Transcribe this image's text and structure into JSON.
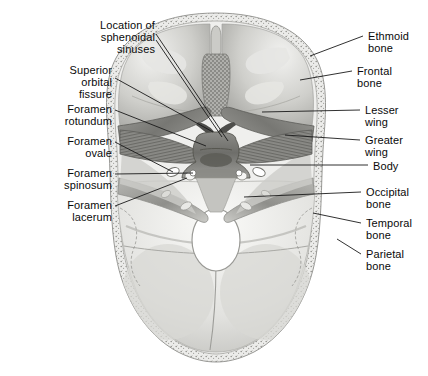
{
  "figure": {
    "type": "anatomical-illustration",
    "background_color": "#ffffff",
    "bone_tone_light": "#e8e8e6",
    "bone_tone_mid": "#b9b9b5",
    "bone_tone_dark": "#8d8d89",
    "bone_tone_darkest": "#6a6a67",
    "leader_color": "#1a1a1a",
    "foramen_magnum_fill": "#ffffff"
  },
  "labels_left": [
    {
      "id": "sphenoidal-sinuses",
      "lines": [
        "Location of",
        "sphenoidal",
        "sinuses"
      ],
      "align": "right",
      "x": 53,
      "y": 19,
      "width": 102
    },
    {
      "id": "superior-orbital-fissure",
      "lines": [
        "Superior",
        "orbital",
        "fissure"
      ],
      "align": "right",
      "x": 40,
      "y": 64,
      "width": 72
    },
    {
      "id": "foramen-rotundum",
      "lines": [
        "Foramen",
        "rotundum"
      ],
      "align": "right",
      "x": 32,
      "y": 103,
      "width": 80
    },
    {
      "id": "foramen-ovale",
      "lines": [
        "Foramen",
        "ovale"
      ],
      "align": "right",
      "x": 32,
      "y": 135,
      "width": 80
    },
    {
      "id": "foramen-spinosum",
      "lines": [
        "Foramen",
        "spinosum"
      ],
      "align": "right",
      "x": 14,
      "y": 167,
      "width": 98
    },
    {
      "id": "foramen-lacerum",
      "lines": [
        "Foramen",
        "lacerum"
      ],
      "align": "right",
      "x": 14,
      "y": 199,
      "width": 98
    }
  ],
  "labels_right": [
    {
      "id": "ethmoid-bone",
      "lines": [
        "Ethmoid",
        "bone"
      ],
      "align": "left",
      "x": 368,
      "y": 30,
      "width": 60
    },
    {
      "id": "frontal-bone",
      "lines": [
        "Frontal",
        "bone"
      ],
      "align": "left",
      "x": 357,
      "y": 65,
      "width": 64
    },
    {
      "id": "lesser-wing",
      "lines": [
        "Lesser",
        "wing"
      ],
      "align": "left",
      "x": 365,
      "y": 104,
      "width": 60
    },
    {
      "id": "greater-wing",
      "lines": [
        "Greater",
        "wing"
      ],
      "align": "left",
      "x": 365,
      "y": 134,
      "width": 62
    },
    {
      "id": "body",
      "lines": [
        "Body"
      ],
      "align": "left",
      "x": 373,
      "y": 160,
      "width": 50
    },
    {
      "id": "occipital-bone",
      "lines": [
        "Occipital",
        "bone"
      ],
      "align": "left",
      "x": 366,
      "y": 186,
      "width": 62
    },
    {
      "id": "temporal-bone",
      "lines": [
        "Temporal",
        "bone"
      ],
      "align": "left",
      "x": 366,
      "y": 217,
      "width": 62
    },
    {
      "id": "parietal-bone",
      "lines": [
        "Parietal",
        "bone"
      ],
      "align": "left",
      "x": 366,
      "y": 248,
      "width": 62
    }
  ],
  "leaders": [
    {
      "id": "leader-sphenoidal-sinuses-a",
      "points": "156,34 228,141"
    },
    {
      "id": "leader-sphenoidal-sinuses-b",
      "points": "156,40 222,137"
    },
    {
      "id": "leader-superior-orbital-fissure",
      "points": "115,78 213,132"
    },
    {
      "id": "leader-foramen-rotundum",
      "points": "115,110 206,146"
    },
    {
      "id": "leader-foramen-ovale",
      "points": "115,142 173,172"
    },
    {
      "id": "leader-foramen-spinosum",
      "points": "115,174 193,173"
    },
    {
      "id": "leader-foramen-lacerum",
      "points": "115,206 187,178"
    },
    {
      "id": "leader-ethmoid-bone",
      "points": "363,36 310,56"
    },
    {
      "id": "leader-frontal-bone",
      "points": "352,71 300,80"
    },
    {
      "id": "leader-lesser-wing",
      "points": "360,110 262,112"
    },
    {
      "id": "leader-greater-wing",
      "points": "360,140 285,135"
    },
    {
      "id": "leader-body",
      "points": "368,165 250,165"
    },
    {
      "id": "leader-occipital-bone",
      "points": "361,192 244,197"
    },
    {
      "id": "leader-temporal-bone",
      "points": "361,223 313,213"
    },
    {
      "id": "leader-parietal-bone",
      "points": "361,254 337,239"
    }
  ],
  "anatomy_parts": [
    {
      "id": "calvarial-rim",
      "name": "diploe-outer-rim"
    },
    {
      "id": "anterior-cranial-fossa-left",
      "name": "anterior-cranial-fossa"
    },
    {
      "id": "anterior-cranial-fossa-right",
      "name": "anterior-cranial-fossa"
    },
    {
      "id": "crista-galli",
      "name": "crista-galli"
    },
    {
      "id": "cribriform-plate",
      "name": "cribriform-plate"
    },
    {
      "id": "lesser-wing-left",
      "name": "lesser-wing-of-sphenoid"
    },
    {
      "id": "lesser-wing-right",
      "name": "lesser-wing-of-sphenoid"
    },
    {
      "id": "greater-wing-left",
      "name": "greater-wing-of-sphenoid"
    },
    {
      "id": "greater-wing-right",
      "name": "greater-wing-of-sphenoid"
    },
    {
      "id": "sella-turcica",
      "name": "sella-turcica-body-of-sphenoid"
    },
    {
      "id": "foramen-ovale-left",
      "name": "foramen-ovale"
    },
    {
      "id": "foramen-ovale-right",
      "name": "foramen-ovale"
    },
    {
      "id": "foramen-spinosum-left",
      "name": "foramen-spinosum"
    },
    {
      "id": "foramen-spinosum-right",
      "name": "foramen-spinosum"
    },
    {
      "id": "petrous-temporal-left",
      "name": "petrous-part-of-temporal-bone"
    },
    {
      "id": "petrous-temporal-right",
      "name": "petrous-part-of-temporal-bone"
    },
    {
      "id": "posterior-cranial-fossa",
      "name": "posterior-cranial-fossa"
    },
    {
      "id": "foramen-magnum",
      "name": "foramen-magnum"
    },
    {
      "id": "internal-occipital-crest",
      "name": "internal-occipital-crest"
    }
  ]
}
